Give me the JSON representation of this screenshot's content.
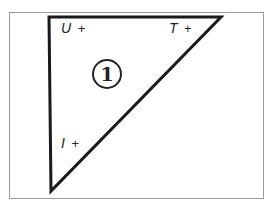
{
  "diagram": {
    "region_number": "1",
    "labels": {
      "top_left": {
        "letter": "U",
        "sign": "+"
      },
      "top_right": {
        "letter": "T",
        "sign": "+"
      },
      "bottom_left": {
        "letter": "I",
        "sign": "+"
      }
    },
    "stroke_color": "#1a1a1a",
    "frame_color": "#9a9a9a"
  }
}
